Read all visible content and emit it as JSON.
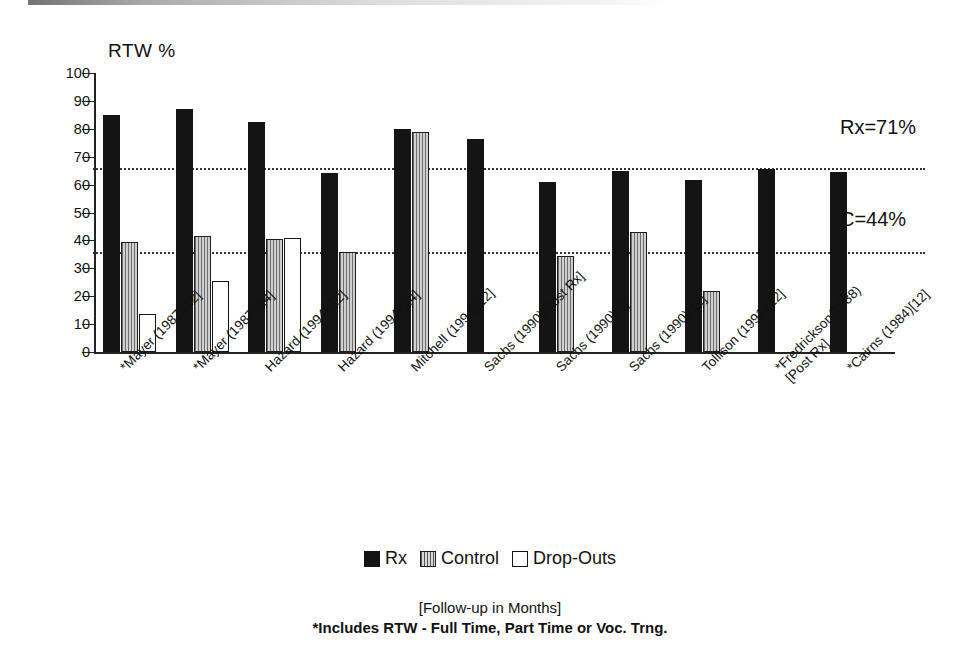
{
  "chart_data": {
    "type": "bar",
    "title": "",
    "ylabel": "RTW %",
    "xlabel": "",
    "ylim": [
      0,
      100
    ],
    "ytick_step": 10,
    "yticks": [
      0,
      10,
      20,
      30,
      40,
      50,
      60,
      70,
      80,
      90,
      100
    ],
    "grid": false,
    "legend_position": "bottom-center",
    "legend": [
      "Rx",
      "Control",
      "Drop-Outs"
    ],
    "categories": [
      "*Mayer (1987)[12]",
      "*Mayer (1987)[24]",
      "Hazard (1994)[12]",
      "Hazard (1994)[24]",
      "Mitchell (1994)[12]",
      "Sachs (1990)[Post Rx]",
      "Sachs (1990)[6]",
      "Sachs (1990)[12]",
      "Tollison (1991)[12]",
      "*Fredrickson(1988) [Post Rx]",
      "*Cairns (1984)[12]"
    ],
    "series": [
      {
        "name": "Rx",
        "color": "#141414",
        "values": [
          85,
          87,
          82.5,
          64,
          80,
          76.5,
          61,
          65,
          61.5,
          65.5,
          64.5
        ]
      },
      {
        "name": "Control",
        "color": "#b9b9b9",
        "values": [
          39.5,
          41.5,
          40.5,
          36,
          79,
          null,
          34.5,
          43,
          22,
          null,
          null
        ]
      },
      {
        "name": "Drop-Outs",
        "color": "#ffffff",
        "values": [
          13.5,
          25.5,
          41,
          null,
          null,
          null,
          null,
          null,
          null,
          null,
          null
        ]
      }
    ],
    "reference_lines": [
      {
        "label": "Rx=71%",
        "value": 66
      },
      {
        "label": "C=44%",
        "value": 36
      }
    ],
    "annotations": [
      "Rx=71%",
      "C=44%"
    ],
    "footnotes": [
      "[Follow-up in Months]",
      "*Includes RTW - Full Time, Part Time or Voc. Trng."
    ]
  },
  "axis": {
    "y_title": "RTW %",
    "tick_labels": [
      "100",
      "90",
      "80",
      "70",
      "60",
      "50",
      "40",
      "30",
      "20",
      "10",
      "0"
    ]
  },
  "xlabels": [
    {
      "line1": "*Mayer (1987)[12]",
      "line2": ""
    },
    {
      "line1": "*Mayer (1987)[24]",
      "line2": ""
    },
    {
      "line1": "Hazard (1994)[12]",
      "line2": ""
    },
    {
      "line1": "Hazard (1994)[24]",
      "line2": ""
    },
    {
      "line1": "Mitchell (1994)[12]",
      "line2": ""
    },
    {
      "line1": "Sachs (1990)[Post Rx]",
      "line2": ""
    },
    {
      "line1": "Sachs (1990)[6]",
      "line2": ""
    },
    {
      "line1": "Sachs (1990)[12]",
      "line2": ""
    },
    {
      "line1": "Tollison (1991)[12]",
      "line2": ""
    },
    {
      "line1": "*Fredrickson(1988)",
      "line2": "[Post Rx]"
    },
    {
      "line1": "*Cairns (1984)[12]",
      "line2": ""
    }
  ],
  "legend": {
    "rx_label": "Rx",
    "control_label": "Control",
    "dropouts_label": "Drop-Outs"
  },
  "annotations": {
    "rx_mean": "Rx=71%",
    "control_mean": "C=44%"
  },
  "footnotes": {
    "line1": "[Follow-up in Months]",
    "line2": "*Includes RTW - Full Time, Part Time or Voc. Trng."
  }
}
